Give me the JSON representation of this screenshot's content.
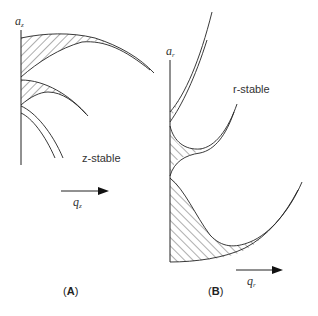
{
  "panel_a": {
    "y_axis_label": "a",
    "y_axis_sub": "z",
    "x_axis_label": "q",
    "x_axis_sub": "z",
    "region_label": "z-stable",
    "caption_open": "(",
    "caption_letter": "A",
    "caption_close": ")"
  },
  "panel_b": {
    "y_axis_label": "a",
    "y_axis_sub": "r",
    "x_axis_label": "q",
    "x_axis_sub": "r",
    "region_label": "r-stable",
    "caption_open": "(",
    "caption_letter": "B",
    "caption_close": ")"
  },
  "colors": {
    "line": "#222222",
    "hatch": "#333333",
    "background": "#ffffff"
  }
}
